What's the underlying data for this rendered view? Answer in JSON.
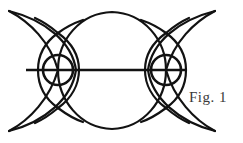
{
  "figure": {
    "caption": "Fig. 1",
    "background_color": "#ffffff",
    "stroke_color": "#121212",
    "caption_color": "#3a3a3a",
    "width": 243,
    "height": 143,
    "axis_y": 70,
    "elements": {
      "central_circle": {
        "cx": 112,
        "cy": 70,
        "r": 59
      },
      "left_outer_circle": {
        "cx": 96,
        "cy": 70,
        "r": 59
      },
      "right_outer_circle": {
        "cx": 128,
        "cy": 70,
        "r": 59
      },
      "left_crescent_inner": {
        "cx": 69,
        "cy": 70,
        "r": 44
      },
      "right_crescent_inner": {
        "cx": 155,
        "cy": 70,
        "r": 44
      },
      "left_lens_left_arc": {
        "cx": 76,
        "cy": 70,
        "r": 38
      },
      "left_lens_right_arc": {
        "cx": 41,
        "cy": 70,
        "r": 38
      },
      "right_lens_left_arc": {
        "cx": 183,
        "cy": 70,
        "r": 38
      },
      "right_lens_right_arc": {
        "cx": 148,
        "cy": 70,
        "r": 38
      },
      "left_small_circle": {
        "cx": 58,
        "cy": 70,
        "r": 15
      },
      "right_small_circle": {
        "cx": 166,
        "cy": 70,
        "r": 15
      },
      "horizontal_line": {
        "x1": 26,
        "y1": 70,
        "x2": 187,
        "y2": 70
      }
    }
  }
}
